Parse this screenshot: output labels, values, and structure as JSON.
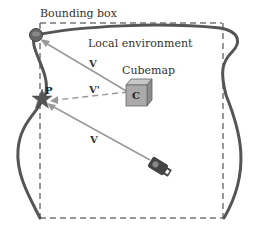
{
  "diagram": {
    "labels": {
      "bounding_box": "Bounding box",
      "local_environment": "Local environment",
      "cubemap": "Cubemap",
      "cubemap_center": "C",
      "point": "P",
      "vector_v_upper": "V",
      "vector_v_prime": "V'",
      "vector_v_lower": "V"
    },
    "colors": {
      "environment_outline": "#555555",
      "bounding_box": "#777777",
      "vectors": "#999999",
      "cube_front": "#aaaaaa",
      "cube_top": "#c8c8c8",
      "cube_side": "#8c8c8c",
      "star": "#555555",
      "camera": "#444444"
    }
  }
}
